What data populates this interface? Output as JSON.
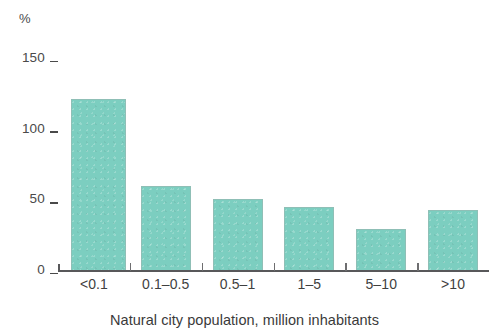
{
  "chart_data": {
    "type": "bar",
    "title": "",
    "subtitle": "",
    "unit_label": "%",
    "categories": [
      "<0.1",
      "0.1–0.5",
      "0.5–1",
      "1–5",
      "5–10",
      ">10"
    ],
    "values": [
      122,
      60,
      51,
      45,
      30,
      43
    ],
    "series": [
      {
        "name": "",
        "values": [
          122,
          60,
          51,
          45,
          30,
          43
        ]
      }
    ],
    "xlabel": "Natural city population, million inhabitants",
    "ylabel": "%",
    "ylim": [
      0,
      150
    ],
    "yticks": [
      0,
      50,
      100,
      150
    ],
    "ytick_labels": [
      "0",
      "50",
      "100",
      "150"
    ],
    "xtick_labels": [
      "<0.1",
      "0.1–0.5",
      "0.5–1",
      "1–5",
      "5–10",
      ">10"
    ],
    "grid": false,
    "legend": false,
    "legend_position": "none",
    "bar_color": "#7ccec0",
    "axis_color": "#58585a",
    "text_color": "#3a3a3a",
    "annotations": []
  },
  "axis": {
    "unit": "%",
    "y_ticks": [
      {
        "label": "150",
        "value": 150
      },
      {
        "label": "100",
        "value": 100
      },
      {
        "label": "50",
        "value": 50
      },
      {
        "label": "0",
        "value": 0
      }
    ],
    "x_title": "Natural city population, million inhabitants"
  }
}
